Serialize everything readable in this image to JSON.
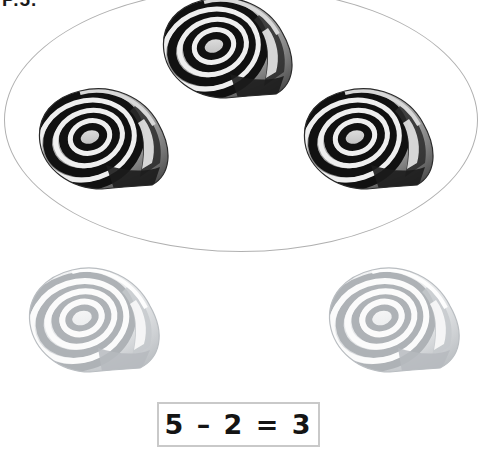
{
  "page": {
    "corner_label": "P.5.",
    "background_color": "#ffffff",
    "width": 485,
    "height": 457
  },
  "group": {
    "name": "circled-group",
    "shape": "ellipse",
    "outline_color": "#b0b0b0",
    "count": 3,
    "item_label": "snail-shell",
    "item_state": "remaining"
  },
  "removed_group": {
    "name": "faded-group",
    "count": 2,
    "item_label": "snail-shell",
    "item_state": "removed",
    "tint_color": "#b8bcc0"
  },
  "equation": {
    "text": "5 – 2 = 3",
    "minuend": "5",
    "operator": "–",
    "subtrahend": "2",
    "equals": "=",
    "result": "3",
    "border_color": "#c9c9c9"
  },
  "shells": [
    {
      "id": "shell-top",
      "state": "remaining",
      "in_group": true,
      "position": "top-center"
    },
    {
      "id": "shell-left",
      "state": "remaining",
      "in_group": true,
      "position": "mid-left"
    },
    {
      "id": "shell-right",
      "state": "remaining",
      "in_group": true,
      "position": "mid-right"
    },
    {
      "id": "shell-faded-left",
      "state": "removed",
      "in_group": false,
      "position": "bottom-left"
    },
    {
      "id": "shell-faded-right",
      "state": "removed",
      "in_group": false,
      "position": "bottom-right"
    }
  ]
}
